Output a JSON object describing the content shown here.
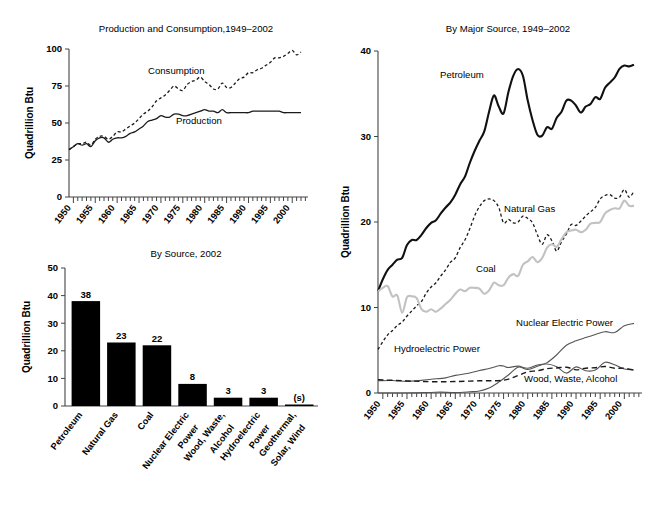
{
  "chart_data": [
    {
      "id": "production_consumption",
      "type": "line",
      "title": "Production and Consumption,1949–2002",
      "ylabel": "Quadrillion Btu",
      "xlabel": "",
      "ylim": [
        0,
        100
      ],
      "yticks": [
        0,
        25,
        50,
        75,
        100
      ],
      "xlim": [
        1949,
        2002
      ],
      "xticks": [
        1950,
        1955,
        1960,
        1965,
        1970,
        1975,
        1980,
        1985,
        1990,
        1995,
        2000
      ],
      "grid": false,
      "legend_position": "inline-annotations",
      "annotations": [
        "Consumption",
        "Production"
      ],
      "series": [
        {
          "name": "Consumption",
          "style": "dotted",
          "x": [
            1949,
            1950,
            1951,
            1952,
            1953,
            1954,
            1955,
            1956,
            1957,
            1958,
            1959,
            1960,
            1961,
            1962,
            1963,
            1964,
            1965,
            1966,
            1967,
            1968,
            1969,
            1970,
            1971,
            1972,
            1973,
            1974,
            1975,
            1976,
            1977,
            1978,
            1979,
            1980,
            1981,
            1982,
            1983,
            1984,
            1985,
            1986,
            1987,
            1988,
            1989,
            1990,
            1991,
            1992,
            1993,
            1994,
            1995,
            1996,
            1997,
            1998,
            1999,
            2000,
            2001,
            2002
          ],
          "values": [
            32,
            34,
            36,
            36,
            37,
            35,
            39,
            41,
            41,
            39,
            41,
            44,
            44,
            46,
            48,
            50,
            53,
            56,
            58,
            61,
            65,
            67,
            69,
            72,
            75,
            73,
            72,
            76,
            78,
            79,
            81,
            78,
            76,
            73,
            73,
            77,
            74,
            74,
            77,
            80,
            81,
            84,
            84,
            86,
            87,
            89,
            91,
            94,
            94,
            95,
            97,
            99,
            96,
            98
          ]
        },
        {
          "name": "Production",
          "style": "solid",
          "x": [
            1949,
            1950,
            1951,
            1952,
            1953,
            1954,
            1955,
            1956,
            1957,
            1958,
            1959,
            1960,
            1961,
            1962,
            1963,
            1964,
            1965,
            1966,
            1967,
            1968,
            1969,
            1970,
            1971,
            1972,
            1973,
            1974,
            1975,
            1976,
            1977,
            1978,
            1979,
            1980,
            1981,
            1982,
            1983,
            1984,
            1985,
            1986,
            1987,
            1988,
            1989,
            1990,
            1991,
            1992,
            1993,
            1994,
            1995,
            1996,
            1997,
            1998,
            1999,
            2000,
            2001,
            2002
          ],
          "values": [
            32,
            34,
            36,
            35,
            36,
            34,
            38,
            40,
            40,
            37,
            39,
            40,
            40,
            41,
            43,
            44,
            46,
            48,
            51,
            52,
            53,
            55,
            54,
            54,
            56,
            56,
            55,
            55,
            56,
            57,
            58,
            59,
            58,
            58,
            57,
            59,
            57,
            57,
            57,
            57,
            57,
            57,
            58,
            58,
            58,
            58,
            58,
            58,
            58,
            57,
            57,
            57,
            57,
            57
          ]
        }
      ]
    },
    {
      "id": "by_source_2002",
      "type": "bar",
      "title": "By Source, 2002",
      "ylabel": "Quadrillion Btu",
      "xlabel": "",
      "ylim": [
        0,
        50
      ],
      "yticks": [
        0,
        10,
        20,
        30,
        40,
        50
      ],
      "grid": false,
      "categories": [
        "Petroleum",
        "Natural Gas",
        "Coal",
        "Nuclear Electric Power",
        "Wood, Waste, Alcohol",
        "Hydroelectric Power",
        "Geothermal, Solar, Wind"
      ],
      "values": [
        38,
        23,
        22,
        8,
        3,
        3,
        0.3
      ],
      "value_labels": [
        "38",
        "23",
        "22",
        "8",
        "3",
        "3",
        "(s)"
      ]
    },
    {
      "id": "by_major_source",
      "type": "line",
      "title": "By Major Source, 1949–2002",
      "ylabel": "Quadrillion Btu",
      "xlabel": "",
      "ylim": [
        0,
        40
      ],
      "yticks": [
        0,
        10,
        20,
        30,
        40
      ],
      "xlim": [
        1949,
        2002
      ],
      "xticks": [
        1950,
        1955,
        1960,
        1965,
        1970,
        1975,
        1980,
        1985,
        1990,
        1995,
        2000
      ],
      "grid": false,
      "legend_position": "inline-annotations",
      "annotations": [
        "Petroleum",
        "Natural Gas",
        "Coal",
        "Nuclear Electric Power",
        "Hydroelectric Power",
        "Wood, Waste, Alcohol"
      ],
      "series": [
        {
          "name": "Petroleum",
          "style": "thick-solid",
          "x": [
            1949,
            1950,
            1951,
            1952,
            1953,
            1954,
            1955,
            1956,
            1957,
            1958,
            1959,
            1960,
            1961,
            1962,
            1963,
            1964,
            1965,
            1966,
            1967,
            1968,
            1969,
            1970,
            1971,
            1972,
            1973,
            1974,
            1975,
            1976,
            1977,
            1978,
            1979,
            1980,
            1981,
            1982,
            1983,
            1984,
            1985,
            1986,
            1987,
            1988,
            1989,
            1990,
            1991,
            1992,
            1993,
            1994,
            1995,
            1996,
            1997,
            1998,
            1999,
            2000,
            2001,
            2002
          ],
          "values": [
            11.9,
            13.3,
            14.4,
            15.0,
            15.6,
            15.8,
            17.3,
            17.9,
            17.9,
            18.5,
            19.3,
            19.9,
            20.2,
            21.0,
            21.7,
            22.3,
            23.2,
            24.4,
            25.3,
            26.9,
            28.3,
            29.5,
            30.6,
            32.9,
            34.8,
            33.5,
            32.7,
            35.2,
            37.1,
            37.9,
            37.1,
            34.2,
            31.9,
            30.2,
            30.1,
            31.1,
            30.9,
            32.2,
            32.9,
            34.2,
            34.2,
            33.6,
            32.8,
            33.5,
            33.8,
            34.6,
            34.4,
            35.7,
            36.3,
            36.9,
            37.9,
            38.3,
            38.2,
            38.4
          ]
        },
        {
          "name": "Natural Gas",
          "style": "dotted",
          "x": [
            1949,
            1950,
            1951,
            1952,
            1953,
            1954,
            1955,
            1956,
            1957,
            1958,
            1959,
            1960,
            1961,
            1962,
            1963,
            1964,
            1965,
            1966,
            1967,
            1968,
            1969,
            1970,
            1971,
            1972,
            1973,
            1974,
            1975,
            1976,
            1977,
            1978,
            1979,
            1980,
            1981,
            1982,
            1983,
            1984,
            1985,
            1986,
            1987,
            1988,
            1989,
            1990,
            1991,
            1992,
            1993,
            1994,
            1995,
            1996,
            1997,
            1998,
            1999,
            2000,
            2001,
            2002
          ],
          "values": [
            5.1,
            6.0,
            6.8,
            7.3,
            7.9,
            8.3,
            9.0,
            9.6,
            10.2,
            10.7,
            11.7,
            12.4,
            12.9,
            13.7,
            14.4,
            15.3,
            15.8,
            17.0,
            17.9,
            19.2,
            20.7,
            21.8,
            22.5,
            22.7,
            22.5,
            21.7,
            19.9,
            20.3,
            19.9,
            20.0,
            20.7,
            20.4,
            19.9,
            18.5,
            17.4,
            18.5,
            17.8,
            16.6,
            17.7,
            18.6,
            19.7,
            19.6,
            20.1,
            20.7,
            21.2,
            21.7,
            22.7,
            23.1,
            23.2,
            22.8,
            22.9,
            23.8,
            22.9,
            23.6
          ]
        },
        {
          "name": "Coal",
          "style": "grey-solid",
          "x": [
            1949,
            1950,
            1951,
            1952,
            1953,
            1954,
            1955,
            1956,
            1957,
            1958,
            1959,
            1960,
            1961,
            1962,
            1963,
            1964,
            1965,
            1966,
            1967,
            1968,
            1969,
            1970,
            1971,
            1972,
            1973,
            1974,
            1975,
            1976,
            1977,
            1978,
            1979,
            1980,
            1981,
            1982,
            1983,
            1984,
            1985,
            1986,
            1987,
            1988,
            1989,
            1990,
            1991,
            1992,
            1993,
            1994,
            1995,
            1996,
            1997,
            1998,
            1999,
            2000,
            2001,
            2002
          ],
          "values": [
            11.9,
            12.3,
            12.5,
            11.3,
            11.4,
            9.4,
            11.2,
            11.3,
            11.1,
            9.8,
            9.5,
            9.8,
            9.5,
            9.9,
            10.4,
            10.9,
            11.6,
            12.1,
            11.9,
            12.3,
            12.3,
            12.2,
            11.6,
            12.0,
            12.9,
            12.6,
            12.6,
            13.5,
            13.9,
            13.7,
            15.0,
            15.4,
            15.9,
            15.3,
            15.8,
            17.0,
            17.4,
            17.1,
            18.0,
            18.8,
            19.0,
            19.1,
            18.8,
            19.1,
            19.8,
            19.9,
            20.0,
            21.0,
            21.4,
            21.6,
            21.6,
            22.5,
            21.9,
            21.9
          ]
        },
        {
          "name": "Nuclear Electric Power",
          "style": "thin-solid",
          "x": [
            1949,
            1955,
            1957,
            1960,
            1962,
            1965,
            1968,
            1970,
            1972,
            1974,
            1976,
            1978,
            1980,
            1982,
            1984,
            1986,
            1988,
            1990,
            1992,
            1994,
            1996,
            1998,
            2000,
            2002
          ],
          "values": [
            0,
            0,
            0.02,
            0.06,
            0.1,
            0.04,
            0.14,
            0.24,
            0.58,
            1.27,
            2.11,
            3.02,
            2.74,
            3.13,
            3.55,
            4.47,
            5.59,
            6.1,
            6.48,
            6.84,
            7.17,
            7.07,
            7.86,
            8.14
          ]
        },
        {
          "name": "Hydroelectric Power",
          "style": "thin-solid",
          "x": [
            1949,
            1952,
            1955,
            1958,
            1960,
            1963,
            1965,
            1968,
            1970,
            1972,
            1974,
            1975,
            1976,
            1978,
            1980,
            1982,
            1984,
            1986,
            1988,
            1990,
            1992,
            1994,
            1996,
            1998,
            2000,
            2002
          ],
          "values": [
            1.43,
            1.46,
            1.36,
            1.48,
            1.61,
            1.77,
            2.06,
            2.34,
            2.63,
            2.86,
            3.18,
            3.15,
            2.98,
            3.14,
            2.9,
            3.27,
            3.39,
            3.07,
            2.33,
            3.05,
            2.6,
            2.68,
            3.59,
            3.3,
            2.81,
            2.69
          ]
        },
        {
          "name": "Wood, Waste, Alcohol",
          "style": "dashed",
          "x": [
            1949,
            1955,
            1960,
            1965,
            1970,
            1975,
            1978,
            1980,
            1982,
            1984,
            1986,
            1988,
            1990,
            1992,
            1994,
            1996,
            1998,
            2000,
            2002
          ],
          "values": [
            1.55,
            1.42,
            1.32,
            1.34,
            1.43,
            1.5,
            2.04,
            2.48,
            2.6,
            2.85,
            2.93,
            3.02,
            2.71,
            2.9,
            2.96,
            3.1,
            2.9,
            2.9,
            2.69
          ]
        }
      ]
    }
  ]
}
